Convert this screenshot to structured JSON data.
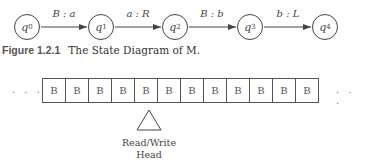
{
  "diagram": {
    "states": [
      {
        "name": "q",
        "sub": "0",
        "x": 14
      },
      {
        "name": "q",
        "sub": "1",
        "x": 88
      },
      {
        "name": "q",
        "sub": "2",
        "x": 162
      },
      {
        "name": "q",
        "sub": "3",
        "x": 237
      },
      {
        "name": "q",
        "sub": "4",
        "x": 312
      }
    ],
    "transitions": [
      {
        "from": "q0",
        "to": "q1",
        "label": "B : a"
      },
      {
        "from": "q1",
        "to": "q2",
        "label": "a : R"
      },
      {
        "from": "q2",
        "to": "q3",
        "label": "B : b"
      },
      {
        "from": "q3",
        "to": "q4",
        "label": "b : L"
      }
    ],
    "caption": {
      "figure_number": "Figure 1.2.1",
      "text": "The State Diagram of M."
    },
    "tape": {
      "cells": [
        "B",
        "B",
        "B",
        "B",
        "B",
        "B",
        "B",
        "B",
        "B",
        "B",
        "B",
        "B"
      ],
      "left_ellipsis": ". . .",
      "right_ellipsis": ". . .",
      "head_position": 4
    },
    "head": {
      "label_line1": "Read/Write",
      "label_line2": "Head"
    }
  }
}
